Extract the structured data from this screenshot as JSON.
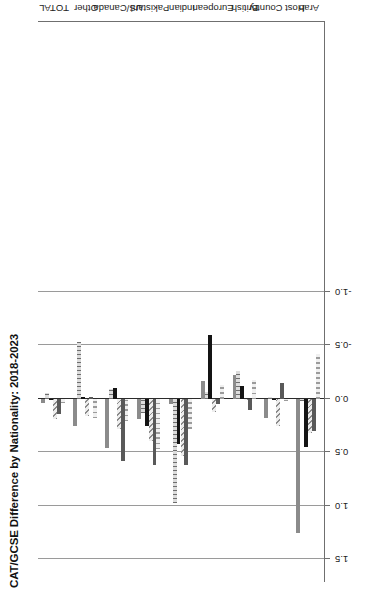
{
  "chart_data": {
    "type": "bar",
    "title": "CAT/GCSE Difference by Nationality: 2018-2023",
    "orientation": "horizontal",
    "xlabel": "",
    "ylabel": "",
    "xlim": [
      1.5,
      -1.0
    ],
    "xticks": [
      "1.5",
      "1.0",
      "0.5",
      "0.0",
      "-0.5",
      "-1.0"
    ],
    "xtick_values": [
      1.5,
      1.0,
      0.5,
      0.0,
      -0.5,
      -1.0
    ],
    "grid": true,
    "legend_position": "right",
    "categories": [
      "TOTAL",
      "Other",
      "US/Canada",
      "Pakistani",
      "Indian",
      "European",
      "British",
      "Host Country",
      "Arab"
    ],
    "series": [
      {
        "name": "2018",
        "color": "#8b8b8b",
        "pattern": "solid",
        "values": [
          0.04,
          0.25,
          0.46,
          0.19,
          0.05,
          -0.17,
          -0.22,
          0.18,
          1.25
        ]
      },
      {
        "name": "2019",
        "color": "#d9d9d9",
        "pattern": "vertical-lines",
        "values": [
          -0.06,
          -0.53,
          -0.09,
          0.13,
          0.97,
          -0.07,
          -0.26,
          -0.02,
          0.02
        ]
      },
      {
        "name": "2020",
        "color": "#141414",
        "pattern": "solid",
        "values": [
          0.01,
          -0.02,
          -0.1,
          0.25,
          0.42,
          -0.6,
          -0.12,
          0.01,
          0.45
        ]
      },
      {
        "name": "2021",
        "color": "#e2e2e2",
        "pattern": "diagonal-hatch",
        "values": [
          0.19,
          0.16,
          0.28,
          0.39,
          0.53,
          0.12,
          0.01,
          0.25,
          0.32
        ]
      },
      {
        "name": "2022",
        "color": "#595959",
        "pattern": "solid",
        "values": [
          0.14,
          -0.02,
          0.58,
          0.62,
          0.62,
          0.05,
          0.1,
          -0.15,
          0.3
        ]
      },
      {
        "name": "2023",
        "color": "#e6e6e6",
        "pattern": "checkered",
        "values": [
          0.04,
          0.18,
          0.21,
          0.47,
          0.28,
          -0.13,
          -0.18,
          0.02,
          -0.42
        ]
      }
    ]
  },
  "legend": {
    "items": [
      {
        "label": "2018",
        "key": "p2018"
      },
      {
        "label": "2019",
        "key": "p2019"
      },
      {
        "label": "2020",
        "key": "p2020"
      },
      {
        "label": "2021",
        "key": "p2021"
      },
      {
        "label": "2022",
        "key": "p2022"
      },
      {
        "label": "2023",
        "key": "p2023"
      }
    ]
  }
}
